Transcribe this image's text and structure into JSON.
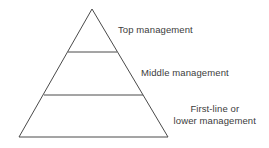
{
  "diagram": {
    "type": "pyramid",
    "levels": [
      {
        "label": "Top management"
      },
      {
        "label": "Middle management"
      },
      {
        "label_line1": "First-line or",
        "label_line2": "lower management"
      }
    ],
    "colors": {
      "stroke": "#4a4a4a",
      "text": "#3c3c3c",
      "background": "#ffffff"
    }
  }
}
